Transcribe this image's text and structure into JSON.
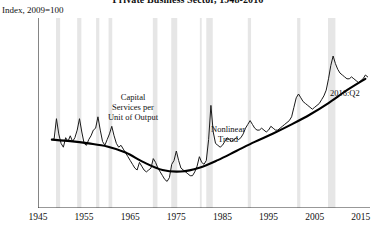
{
  "header": {
    "title": "Private Business Sector, 1948-2016",
    "index_note": "Index, 2009=100"
  },
  "annotations": {
    "series_label": "Capital\nServices per\nUnit of Output",
    "series_label_l1": "Capital",
    "series_label_l2": "Services per",
    "series_label_l3": "Unit of Output",
    "trend_label_l1": "Nonlinear",
    "trend_label_l2": "Trend",
    "endpoint_label": "2016:Q2"
  },
  "colors": {
    "series": "#1a1a1a",
    "trend": "#000000",
    "recession_band": "#e6e6e6",
    "axis": "#333333",
    "background": "#ffffff"
  },
  "chart_data": {
    "type": "line",
    "title": "Private Business Sector, 1948-2016",
    "subtitle": "Index, 2009=100",
    "xlabel": "",
    "ylabel": "Index, 2009=100",
    "xlim": [
      1945,
      2017
    ],
    "ylim": [
      60,
      110
    ],
    "ytick_values": [
      60,
      65,
      70,
      75,
      80,
      85,
      90,
      95,
      100,
      105,
      110
    ],
    "ytick_labels": [
      "60",
      "65",
      "70",
      "75",
      "80",
      "85",
      "90",
      "95",
      "100",
      "105",
      "110"
    ],
    "xtick_values": [
      1945,
      1955,
      1965,
      1975,
      1985,
      1995,
      2005,
      2015
    ],
    "xtick_labels": [
      "1945",
      "1955",
      "1965",
      "1975",
      "1985",
      "1995",
      "2005",
      "2015"
    ],
    "grid": false,
    "legend": "none",
    "series": [
      {
        "name": "Capital Services per Unit of Output",
        "style": "thin-jagged-line",
        "x": [
          1948.0,
          1948.5,
          1949.0,
          1949.5,
          1950.0,
          1950.5,
          1951.0,
          1951.5,
          1952.0,
          1952.5,
          1953.0,
          1953.5,
          1954.0,
          1954.5,
          1955.0,
          1955.5,
          1956.0,
          1956.5,
          1957.0,
          1957.5,
          1958.0,
          1958.5,
          1959.0,
          1959.5,
          1960.0,
          1960.5,
          1961.0,
          1961.5,
          1962.0,
          1962.5,
          1963.0,
          1963.5,
          1964.0,
          1964.5,
          1965.0,
          1965.5,
          1966.0,
          1966.5,
          1967.0,
          1967.5,
          1968.0,
          1968.5,
          1969.0,
          1969.5,
          1970.0,
          1970.5,
          1971.0,
          1971.5,
          1972.0,
          1972.5,
          1973.0,
          1973.5,
          1974.0,
          1974.5,
          1975.0,
          1975.5,
          1976.0,
          1976.5,
          1977.0,
          1977.5,
          1978.0,
          1978.5,
          1979.0,
          1979.5,
          1980.0,
          1980.5,
          1981.0,
          1981.5,
          1982.0,
          1982.5,
          1983.0,
          1983.5,
          1984.0,
          1984.5,
          1985.0,
          1985.5,
          1986.0,
          1986.5,
          1987.0,
          1987.5,
          1988.0,
          1988.5,
          1989.0,
          1989.5,
          1990.0,
          1990.5,
          1991.0,
          1991.5,
          1992.0,
          1992.5,
          1993.0,
          1993.5,
          1994.0,
          1994.5,
          1995.0,
          1995.5,
          1996.0,
          1996.5,
          1997.0,
          1997.5,
          1998.0,
          1998.5,
          1999.0,
          1999.5,
          2000.0,
          2000.5,
          2001.0,
          2001.5,
          2002.0,
          2002.5,
          2003.0,
          2003.5,
          2004.0,
          2004.5,
          2005.0,
          2005.5,
          2006.0,
          2006.5,
          2007.0,
          2007.5,
          2008.0,
          2008.5,
          2009.0,
          2009.5,
          2010.0,
          2010.5,
          2011.0,
          2011.5,
          2012.0,
          2012.5,
          2013.0,
          2013.5,
          2014.0,
          2014.5,
          2015.0,
          2015.5,
          2016.0,
          2016.5
        ],
        "y": [
          78.0,
          78.2,
          83.5,
          79.5,
          77.0,
          76.0,
          78.5,
          77.5,
          79.0,
          77.5,
          78.5,
          80.5,
          83.5,
          80.0,
          77.0,
          76.5,
          78.0,
          79.0,
          80.5,
          81.0,
          84.0,
          80.5,
          77.5,
          76.5,
          78.0,
          79.5,
          81.5,
          79.0,
          77.0,
          76.0,
          76.5,
          75.5,
          74.5,
          73.5,
          72.5,
          71.5,
          70.5,
          70.0,
          72.0,
          71.0,
          70.0,
          69.5,
          70.0,
          70.5,
          73.0,
          72.0,
          70.5,
          69.5,
          68.5,
          67.5,
          67.0,
          68.0,
          71.5,
          72.5,
          75.0,
          72.5,
          70.5,
          70.0,
          69.5,
          69.0,
          68.5,
          68.5,
          69.5,
          71.0,
          73.5,
          72.0,
          71.5,
          72.5,
          78.0,
          87.0,
          80.0,
          77.0,
          76.5,
          76.0,
          76.5,
          77.5,
          78.5,
          78.0,
          77.5,
          78.0,
          78.5,
          78.0,
          78.5,
          79.5,
          81.0,
          82.0,
          83.0,
          82.0,
          81.0,
          80.5,
          80.5,
          81.0,
          80.5,
          80.0,
          80.5,
          81.5,
          81.0,
          80.5,
          80.5,
          81.0,
          81.5,
          82.0,
          82.5,
          83.0,
          84.0,
          86.5,
          89.0,
          90.0,
          89.0,
          88.0,
          87.5,
          87.0,
          86.5,
          86.0,
          86.5,
          87.0,
          87.5,
          88.5,
          89.5,
          91.0,
          94.0,
          97.5,
          100.0,
          98.0,
          96.5,
          95.5,
          95.0,
          94.5,
          94.0,
          94.0,
          94.5,
          94.0,
          93.5,
          93.0,
          93.5,
          94.0,
          95.0,
          94.5
        ]
      },
      {
        "name": "Nonlinear Trend",
        "style": "thick-smooth-line",
        "x": [
          1948,
          1952,
          1956,
          1960,
          1964,
          1968,
          1972,
          1976,
          1980,
          1984,
          1988,
          1992,
          1996,
          2000,
          2004,
          2008,
          2012,
          2016
        ],
        "y": [
          78.0,
          77.6,
          77.0,
          76.2,
          74.6,
          72.0,
          70.0,
          69.6,
          70.6,
          72.6,
          75.0,
          77.4,
          79.6,
          82.0,
          84.6,
          87.6,
          91.0,
          94.0
        ]
      }
    ],
    "recession_bands": [
      {
        "start": 1948.9,
        "end": 1949.8
      },
      {
        "start": 1953.5,
        "end": 1954.4
      },
      {
        "start": 1957.6,
        "end": 1958.3
      },
      {
        "start": 1960.3,
        "end": 1961.1
      },
      {
        "start": 1969.9,
        "end": 1970.9
      },
      {
        "start": 1973.9,
        "end": 1975.2
      },
      {
        "start": 1980.1,
        "end": 1980.5
      },
      {
        "start": 1981.5,
        "end": 1982.9
      },
      {
        "start": 1990.5,
        "end": 1991.2
      },
      {
        "start": 2001.2,
        "end": 2001.9
      },
      {
        "start": 2007.9,
        "end": 2009.5
      }
    ]
  }
}
